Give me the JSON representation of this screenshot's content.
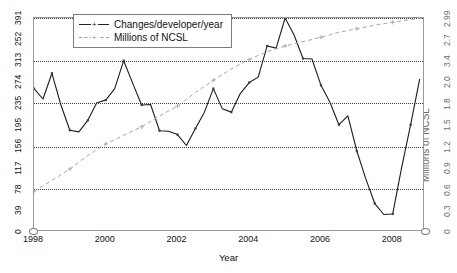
{
  "chart_data": {
    "type": "line",
    "title": "",
    "xlabel": "Year",
    "ylabel": "Changes/developer/year",
    "y2label": "Millions of NCSL",
    "grid": true,
    "legend_position": "top-left-inside",
    "xlim": [
      1998.0,
      2008.9
    ],
    "xticks": [
      "1998",
      "2000",
      "2002",
      "2004",
      "2006",
      "2008"
    ],
    "xtick_values": [
      1998,
      2000,
      2002,
      2004,
      2006,
      2008
    ],
    "ylim": [
      0,
      391
    ],
    "yticks": [
      "0",
      "39",
      "78",
      "117",
      "156",
      "195",
      "235",
      "274",
      "313",
      "252",
      "391"
    ],
    "ytick_values": [
      0,
      39,
      78,
      117,
      156,
      195,
      235,
      274,
      313,
      352,
      391
    ],
    "y2lim": [
      0,
      2.99
    ],
    "y2ticks": [
      "0",
      "0.3",
      "0.6",
      "0.9",
      "1.2",
      "1.5",
      "1.8",
      "2.0",
      "3.4",
      "2.7",
      "2.99"
    ],
    "y2tick_values": [
      0,
      0.3,
      0.6,
      0.9,
      1.2,
      1.5,
      1.8,
      2.1,
      2.4,
      2.7,
      2.99
    ],
    "gridline_values": [
      0,
      78,
      156,
      235,
      313,
      391
    ],
    "series": [
      {
        "name": "Changes/developer/year",
        "axis": "left",
        "style": "solid",
        "color": "#1c1c1c",
        "x": [
          1998.0,
          1998.25,
          1998.5,
          1998.75,
          1999.0,
          1999.25,
          1999.5,
          1999.75,
          2000.0,
          2000.25,
          2000.5,
          2000.75,
          2001.0,
          2001.25,
          2001.5,
          2001.75,
          2002.0,
          2002.25,
          2002.5,
          2002.75,
          2003.0,
          2003.25,
          2003.5,
          2003.75,
          2004.0,
          2004.25,
          2004.5,
          2004.75,
          2005.0,
          2005.25,
          2005.5,
          2005.75,
          2006.0,
          2006.25,
          2006.5,
          2006.75,
          2007.0,
          2007.25,
          2007.5,
          2007.75,
          2008.0,
          2008.25,
          2008.5,
          2008.75
        ],
        "y": [
          262,
          243,
          290,
          232,
          186,
          183,
          204,
          236,
          241,
          262,
          313,
          272,
          232,
          233,
          185,
          184,
          178,
          158,
          189,
          219,
          262,
          225,
          219,
          253,
          273,
          283,
          340,
          336,
          391,
          360,
          317,
          316,
          268,
          237,
          196,
          212,
          148,
          97,
          52,
          32,
          33,
          118,
          196,
          279
        ]
      },
      {
        "name": "Millions of NCSL",
        "axis": "right",
        "style": "dashed",
        "color": "#a8a8a8",
        "x": [
          1998.0,
          1998.5,
          1999.0,
          1999.5,
          2000.0,
          2000.5,
          2001.0,
          2001.5,
          2002.0,
          2002.5,
          2003.0,
          2003.5,
          2004.0,
          2004.5,
          2005.0,
          2005.5,
          2006.0,
          2006.5,
          2007.0,
          2007.5,
          2008.0,
          2008.5,
          2008.9
        ],
        "y": [
          0.57,
          0.72,
          0.88,
          1.07,
          1.23,
          1.35,
          1.47,
          1.62,
          1.76,
          1.95,
          2.12,
          2.28,
          2.41,
          2.52,
          2.6,
          2.66,
          2.72,
          2.79,
          2.84,
          2.89,
          2.93,
          2.97,
          2.99
        ]
      }
    ]
  },
  "legend": {
    "items": [
      {
        "label": "Changes/developer/year",
        "marker": "plus",
        "style": "solid"
      },
      {
        "label": "Millions of NCSL",
        "marker": "plus",
        "style": "dashed"
      }
    ]
  }
}
